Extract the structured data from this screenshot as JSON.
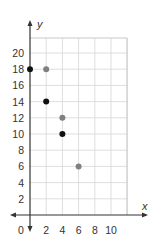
{
  "chart_data": {
    "type": "scatter",
    "title": "",
    "xlabel": "x",
    "ylabel": "y",
    "xlim": [
      0,
      12
    ],
    "ylim": [
      0,
      22
    ],
    "x_ticks": [
      2,
      4,
      6,
      8,
      10
    ],
    "y_ticks": [
      2,
      4,
      6,
      8,
      10,
      12,
      14,
      16,
      18,
      20
    ],
    "origin_label": "0",
    "grid": true,
    "legend": null,
    "series": [
      {
        "name": "black points",
        "color": "#111111",
        "points": [
          [
            0,
            18
          ],
          [
            2,
            14
          ],
          [
            4,
            10
          ]
        ]
      },
      {
        "name": "gray points",
        "color": "#808080",
        "points": [
          [
            2,
            18
          ],
          [
            4,
            12
          ],
          [
            6,
            6
          ]
        ]
      }
    ]
  },
  "colors": {
    "axis": "#333333",
    "grid": "#d6d6d6",
    "border": "#c8c8c8"
  }
}
